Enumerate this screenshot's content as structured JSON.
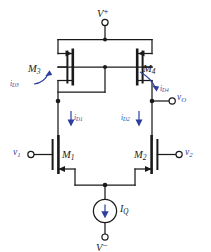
{
  "figure": {
    "kind": "circuit-schematic",
    "ink_color": "#1a1a1a",
    "annotation_color": "#2b3f9e",
    "background": "#ffffff"
  },
  "rails": {
    "positive": {
      "symbol": "V",
      "superscript": "+",
      "text": "V+"
    },
    "negative": {
      "symbol": "V",
      "superscript": "−",
      "text": "V−"
    }
  },
  "transistors": [
    {
      "id": "M3",
      "name": "M",
      "subscript": "3",
      "type": "pmos",
      "role": "active-load-diode-connected"
    },
    {
      "id": "M4",
      "name": "M",
      "subscript": "4",
      "type": "pmos",
      "role": "active-load-mirror"
    },
    {
      "id": "M1",
      "name": "M",
      "subscript": "1",
      "type": "nmos",
      "role": "input-differential-pair"
    },
    {
      "id": "M2",
      "name": "M",
      "subscript": "2",
      "type": "nmos",
      "role": "input-differential-pair"
    }
  ],
  "currents": [
    {
      "id": "iD3",
      "name": "i",
      "subscript": "D3",
      "style": "curved-arrow"
    },
    {
      "id": "iD4",
      "name": "i",
      "subscript": "D4",
      "style": "curved-arrow"
    },
    {
      "id": "iD1",
      "name": "i",
      "subscript": "D1",
      "style": "straight-down-arrow"
    },
    {
      "id": "iD2",
      "name": "i",
      "subscript": "D2",
      "style": "straight-down-arrow"
    }
  ],
  "signals": [
    {
      "id": "v1",
      "name": "v",
      "subscript": "1",
      "kind": "input-terminal",
      "side": "left"
    },
    {
      "id": "v2",
      "name": "v",
      "subscript": "2",
      "kind": "input-terminal",
      "side": "right"
    },
    {
      "id": "vO",
      "name": "v",
      "subscript": "O",
      "kind": "output-terminal",
      "side": "right"
    }
  ],
  "source": {
    "id": "IQ",
    "name": "I",
    "subscript": "Q",
    "kind": "dc-current-source",
    "direction": "down"
  }
}
